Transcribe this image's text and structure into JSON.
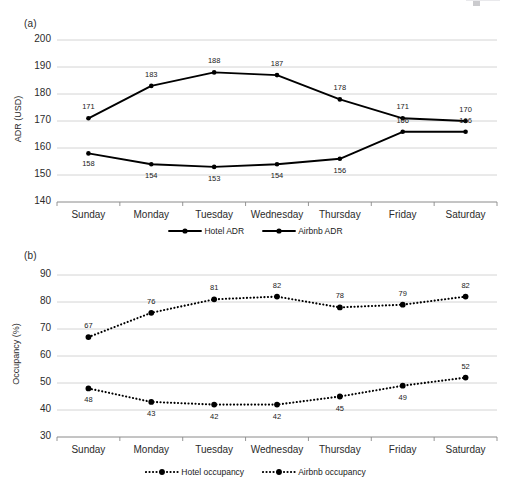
{
  "figure": {
    "width": 511,
    "height": 484,
    "background": "#ffffff"
  },
  "panel_a": {
    "label": "(a)",
    "ylabel": "ADR (USD)",
    "yticks": [
      "200",
      "190",
      "180",
      "170",
      "160",
      "150",
      "140"
    ],
    "xticks": [
      "Sunday",
      "Monday",
      "Tuesday",
      "Wednesday",
      "Thursday",
      "Friday",
      "Saturday"
    ],
    "legend": [
      {
        "label": "Hotel ADR",
        "style": "solid",
        "marker": "circle",
        "color": "#000000"
      },
      {
        "label": "Airbnb ADR",
        "style": "solid",
        "marker": "circle",
        "color": "#000000"
      }
    ]
  },
  "panel_b": {
    "label": "(b)",
    "ylabel": "Occupancy (%)",
    "yticks": [
      "90",
      "80",
      "70",
      "60",
      "50",
      "40",
      "30"
    ],
    "xticks": [
      "Sunday",
      "Monday",
      "Tuesday",
      "Wednesday",
      "Thursday",
      "Friday",
      "Saturday"
    ],
    "legend": [
      {
        "label": "Hotel occupancy",
        "style": "dotted",
        "marker": "circle",
        "color": "#000000"
      },
      {
        "label": "Airbnb occupancy",
        "style": "dotted",
        "marker": "circle",
        "color": "#000000"
      }
    ]
  },
  "chart_data": [
    {
      "type": "line",
      "panel": "(a)",
      "title": "",
      "xlabel": "",
      "ylabel": "ADR (USD)",
      "categories": [
        "Sunday",
        "Monday",
        "Tuesday",
        "Wednesday",
        "Thursday",
        "Friday",
        "Saturday"
      ],
      "ylim": [
        140,
        200
      ],
      "ytick_step": 10,
      "grid": "horizontal",
      "legend_position": "bottom",
      "series": [
        {
          "name": "Hotel ADR",
          "values": [
            171,
            183,
            188,
            187,
            178,
            171,
            170
          ],
          "labels": [
            "171",
            "183",
            "188",
            "187",
            "178",
            "171",
            "170"
          ],
          "linestyle": "solid",
          "color": "#000000"
        },
        {
          "name": "Airbnb ADR",
          "values": [
            158,
            154,
            153,
            154,
            156,
            166,
            166
          ],
          "labels": [
            "158",
            "154",
            "153",
            "154",
            "156",
            "166",
            "166"
          ],
          "linestyle": "solid",
          "color": "#000000"
        }
      ]
    },
    {
      "type": "line",
      "panel": "(b)",
      "title": "",
      "xlabel": "",
      "ylabel": "Occupancy (%)",
      "categories": [
        "Sunday",
        "Monday",
        "Tuesday",
        "Wednesday",
        "Thursday",
        "Friday",
        "Saturday"
      ],
      "ylim": [
        30,
        90
      ],
      "ytick_step": 10,
      "grid": "horizontal",
      "legend_position": "bottom",
      "series": [
        {
          "name": "Hotel occupancy",
          "values": [
            48,
            43,
            42,
            42,
            45,
            49,
            52
          ],
          "labels": [
            "48",
            "43",
            "42",
            "42",
            "45",
            "49",
            "52"
          ],
          "linestyle": "dotted",
          "color": "#000000"
        },
        {
          "name": "Airbnb occupancy",
          "values": [
            67,
            76,
            81,
            82,
            78,
            79,
            82
          ],
          "labels": [
            "67",
            "76",
            "81",
            "82",
            "78",
            "79",
            "82"
          ],
          "linestyle": "dotted",
          "color": "#000000"
        }
      ]
    }
  ],
  "colors": {
    "line": "#000000",
    "grid": "#c9c9c9",
    "axis": "#8a8a8a",
    "text": "#1a1a1a"
  }
}
